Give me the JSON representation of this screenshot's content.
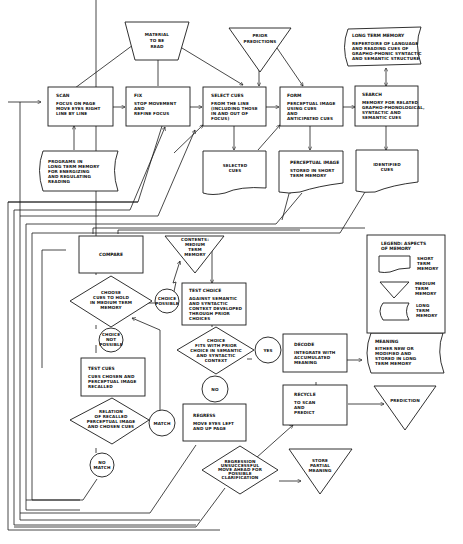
{
  "diagram": {
    "type": "flowchart",
    "nodes": {
      "material": {
        "shape": "trapezoid",
        "lines": [
          "MATERIAL",
          "TO BE",
          "READ"
        ]
      },
      "prior_predictions": {
        "shape": "triangle",
        "lines": [
          "PRIOR",
          "PREDICTIONS"
        ]
      },
      "long_term_memory": {
        "shape": "long-term-memory",
        "title": "LONG TERM MEMORY",
        "lines": [
          "REPERTOIRE OF LANGUAGE",
          "AND READING CUES OF",
          "GRAPHO-PHONIC SYNTACTIC",
          "AND SEMANTIC STRUCTURE"
        ]
      },
      "scan": {
        "shape": "box",
        "title": "SCAN",
        "lines": [
          "FOCUS ON PAGE",
          "MOVE EYES RIGHT",
          "LINE BY LINE"
        ]
      },
      "fix": {
        "shape": "box",
        "title": "FIX",
        "lines": [
          "STOP MOVEMENT",
          "AND",
          "REFINE FOCUS"
        ]
      },
      "select_cues": {
        "shape": "box",
        "title": "SELECT CUES",
        "lines": [
          "FROM THE LINE",
          "(INCLUDING THOSE",
          "IN AND OUT OF",
          "FOCUS)"
        ]
      },
      "form": {
        "shape": "box",
        "title": "FORM",
        "lines": [
          "PERCEPTUAL IMAGE",
          "USING CUES",
          "AND",
          "ANTICIPATED CUES"
        ]
      },
      "search": {
        "shape": "box",
        "title": "SEARCH",
        "lines": [
          "MEMORY FOR RELATED",
          "GRAPHO-PHONOLOGICAL,",
          "SYNTACTIC AND",
          "SEMANTIC CUES"
        ]
      },
      "programs": {
        "shape": "long-term-memory",
        "lines": [
          "PROGRAMS IN",
          "LONG TERM MEMORY",
          "FOR ENERGIZING",
          "AND REGULATING",
          "READING"
        ]
      },
      "selected_cues": {
        "shape": "short-term-memory",
        "lines": [
          "SELECTED",
          "CUES"
        ]
      },
      "perceptual_image": {
        "shape": "short-term-memory",
        "title": "PERCEPTUAL IMAGE",
        "lines": [
          "STORED IN SHORT",
          "TERM MEMORY"
        ]
      },
      "identified_cues": {
        "shape": "short-term-memory",
        "lines": [
          "IDENTIFIED",
          "CUES"
        ]
      },
      "compare": {
        "shape": "box",
        "title": "COMPARE"
      },
      "contents_mtm": {
        "shape": "triangle",
        "lines": [
          "CONTENTS:",
          "MEDIUM",
          "TERM",
          "MEMORY"
        ]
      },
      "choose_cues": {
        "shape": "diamond",
        "lines": [
          "CHOOSE",
          "CUES TO HOLD",
          "IN MEDIUM TERM",
          "MEMORY"
        ]
      },
      "choice_possible": {
        "shape": "circle",
        "lines": [
          "CHOICE",
          "POSSIBLE"
        ]
      },
      "test_choice": {
        "shape": "box",
        "title": "TEST CHOICE",
        "lines": [
          "AGAINST SEMANTIC",
          "AND SYNTACTIC",
          "CONTEXT DEVELOPED",
          "THROUGH PRIOR",
          "CHOICES"
        ]
      },
      "choice_not_possible": {
        "shape": "circle",
        "lines": [
          "CHOICE",
          "NOT",
          "POSSIBLE"
        ]
      },
      "choice_fits": {
        "shape": "diamond",
        "lines": [
          "CHOICE",
          "FITS WITH PRIOR",
          "CHOICE IN SEMANTIC",
          "AND SYNTACTIC",
          "CONTEXT"
        ]
      },
      "yes": {
        "shape": "circle",
        "lines": [
          "YES"
        ]
      },
      "decode": {
        "shape": "box",
        "title": "DECODE",
        "lines": [
          "INTEGRATE WITH",
          "ACCUMULATED",
          "MEANING"
        ]
      },
      "meaning": {
        "shape": "long-term-memory",
        "title": "MEANING",
        "lines": [
          "EITHER NEW OR",
          "MODIFIED AND",
          "STORED IN LONG",
          "TERM MEMORY"
        ]
      },
      "test_cues": {
        "shape": "box",
        "title": "TEST CUES",
        "lines": [
          "CUES CHOSEN AND",
          "PERCEPTUAL IMAGE",
          "RECALLED"
        ]
      },
      "no": {
        "shape": "circle",
        "lines": [
          "NO"
        ]
      },
      "recycle": {
        "shape": "box",
        "title": "RECYCLE",
        "lines": [
          "TO SCAN",
          "AND",
          "PREDICT"
        ]
      },
      "prediction": {
        "shape": "triangle",
        "lines": [
          "PREDICTION"
        ]
      },
      "relation": {
        "shape": "diamond",
        "lines": [
          "RELATION",
          "OF RECALLED",
          "PERCEPTUAL IMAGE",
          "AND CHOSEN CUES"
        ]
      },
      "match": {
        "shape": "circle",
        "lines": [
          "MATCH"
        ]
      },
      "regress": {
        "shape": "box",
        "title": "REGRESS",
        "lines": [
          "MOVE EYES LEFT",
          "AND UP PAGE"
        ]
      },
      "no_match": {
        "shape": "circle",
        "lines": [
          "NO",
          "MATCH"
        ]
      },
      "regression_unsuccessful": {
        "shape": "diamond",
        "lines": [
          "REGRESSION",
          "UNSUCCESSFUL",
          "MOVE AHEAD FOR",
          "POSSIBLE",
          "CLARIFICATION"
        ]
      },
      "store_partial": {
        "shape": "triangle",
        "lines": [
          "STORE",
          "PARTIAL",
          "MEANING"
        ]
      }
    },
    "legend": {
      "title_lines": [
        "LEGEND: ASPECTS",
        "OF MEMORY"
      ],
      "items": [
        {
          "shape": "short-term-memory",
          "lines": [
            "SHORT",
            "TERM",
            "MEMORY"
          ]
        },
        {
          "shape": "medium-term-memory",
          "lines": [
            "MEDIUM",
            "TERM",
            "MEMORY"
          ]
        },
        {
          "shape": "long-term-memory",
          "lines": [
            "LONG",
            "TERM",
            "MEMORY"
          ]
        }
      ]
    }
  }
}
